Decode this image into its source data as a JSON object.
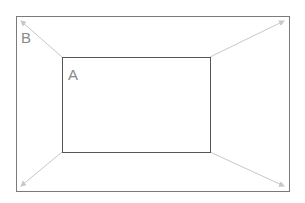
{
  "diagram": {
    "outer_box": {
      "label": "B",
      "x": 16,
      "y": 16,
      "width": 273,
      "height": 175,
      "stroke": "#7a7a7a"
    },
    "inner_box": {
      "label": "A",
      "x": 62,
      "y": 57,
      "width": 148,
      "height": 95,
      "stroke": "#555555"
    },
    "connectors": [
      {
        "name": "top-left",
        "from": [
          62,
          57
        ],
        "to": [
          20,
          20
        ]
      },
      {
        "name": "top-right",
        "from": [
          210,
          57
        ],
        "to": [
          285,
          20
        ]
      },
      {
        "name": "bottom-left",
        "from": [
          62,
          152
        ],
        "to": [
          20,
          187
        ]
      },
      {
        "name": "bottom-right",
        "from": [
          210,
          152
        ],
        "to": [
          285,
          187
        ]
      }
    ],
    "connector_color": "#c8c8c8",
    "label_color": "#8a8a8a"
  }
}
